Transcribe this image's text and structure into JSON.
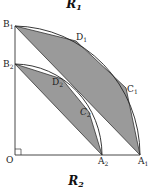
{
  "figure": {
    "top_label": {
      "main": "R",
      "sub": "1"
    },
    "bottom_label": {
      "main": "R",
      "sub": "2"
    }
  },
  "points": {
    "O": {
      "name": "O",
      "sub": ""
    },
    "B1": {
      "name": "B",
      "sub": "1"
    },
    "B2": {
      "name": "B",
      "sub": "2"
    },
    "A1": {
      "name": "A",
      "sub": "1"
    },
    "A2": {
      "name": "A",
      "sub": "2"
    },
    "C1": {
      "name": "C",
      "sub": "1"
    },
    "C2": {
      "name": "C",
      "sub": "2"
    },
    "D1": {
      "name": "D",
      "sub": "1"
    },
    "D2": {
      "name": "D",
      "sub": "2"
    }
  },
  "colors": {
    "shade": "#9a9a9a",
    "stroke": "#222222"
  }
}
